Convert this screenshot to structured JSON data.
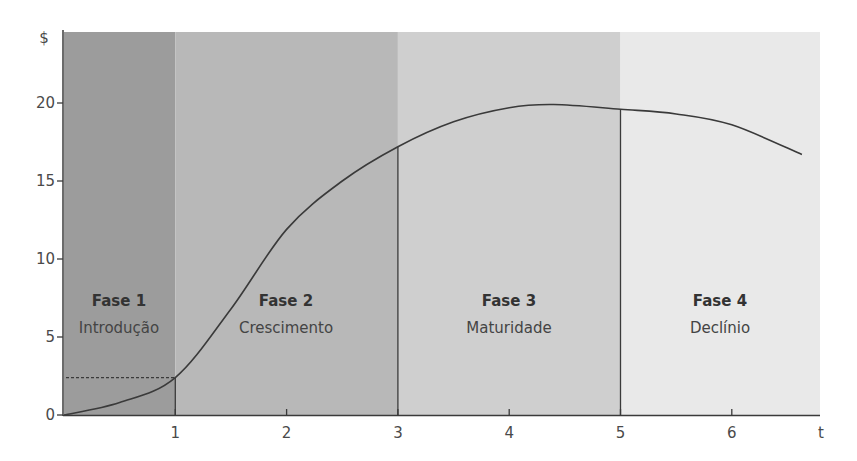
{
  "chart_data": {
    "type": "line",
    "title": "",
    "xlabel": "t",
    "ylabel": "$",
    "xlim": [
      0,
      6.8
    ],
    "ylim": [
      0,
      22.5
    ],
    "x_ticks": [
      "1",
      "2",
      "3",
      "4",
      "5",
      "6"
    ],
    "y_ticks": [
      "0",
      "5",
      "10",
      "15",
      "20"
    ],
    "grid": false,
    "legend": null,
    "series": [
      {
        "name": "Ciclo de vida",
        "x": [
          0,
          0.5,
          1,
          1.5,
          2,
          2.5,
          3,
          3.5,
          4,
          4.4,
          5,
          5.5,
          6,
          6.63
        ],
        "values": [
          0,
          0.8,
          2.4,
          6.8,
          11.9,
          15.0,
          17.2,
          18.8,
          19.7,
          19.9,
          19.6,
          19.3,
          18.6,
          16.7
        ]
      }
    ],
    "phases": [
      {
        "title": "Fase 1",
        "subtitle": "Introdução",
        "start": 0,
        "end": 1,
        "color": "#9c9c9c"
      },
      {
        "title": "Fase 2",
        "subtitle": "Crescimento",
        "start": 1,
        "end": 3,
        "color": "#b8b8b8"
      },
      {
        "title": "Fase 3",
        "subtitle": "Maturidade",
        "start": 3,
        "end": 5,
        "color": "#cfcfcf"
      },
      {
        "title": "Fase 4",
        "subtitle": "Declínio",
        "start": 5,
        "end": 6.8,
        "color": "#e9e9e9"
      }
    ],
    "annotations": [
      {
        "type": "dotted-hline",
        "y": 2.4,
        "x_from": 0,
        "x_to": 1
      },
      {
        "type": "vline",
        "x": 1
      },
      {
        "type": "vline",
        "x": 3
      },
      {
        "type": "vline",
        "x": 5
      }
    ]
  },
  "axes": {
    "y_label": "$",
    "x_label": "t"
  }
}
